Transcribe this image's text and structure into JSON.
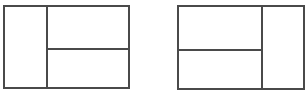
{
  "diagram": {
    "line_color": "#4a4a4a",
    "background": "#ffffff",
    "figures": [
      {
        "id": "left-layout",
        "description": "Rectangle split by a vertical line; right part split horizontally into two",
        "outer": {
          "x": 3,
          "y": 5,
          "w": 127,
          "h": 84
        },
        "vertical_divider_x": 46,
        "horizontal_divider": {
          "y": 48,
          "from_x": 46,
          "to_x": 130
        },
        "panels": [
          "left-tall",
          "right-top",
          "right-bottom"
        ]
      },
      {
        "id": "right-layout",
        "description": "Rectangle split by a vertical line; left part split horizontally into two",
        "outer": {
          "x": 177,
          "y": 5,
          "w": 128,
          "h": 85
        },
        "vertical_divider_x": 261,
        "horizontal_divider": {
          "y": 49,
          "from_x": 177,
          "to_x": 261
        },
        "panels": [
          "left-top",
          "left-bottom",
          "right-tall"
        ]
      }
    ]
  }
}
